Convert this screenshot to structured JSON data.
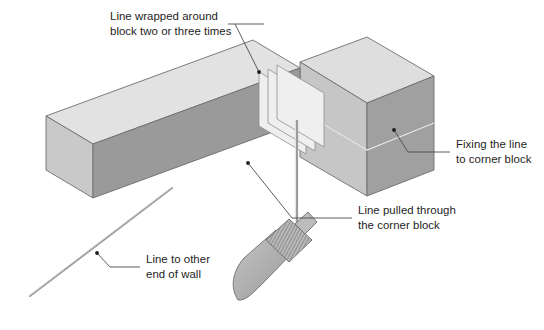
{
  "figure": {
    "background_color": "#ffffff",
    "annotations": [
      {
        "id": "line-wrapped",
        "line1": "Line wrapped around",
        "line2": "block two or three times"
      },
      {
        "id": "fixing-line",
        "line1": "Fixing the line",
        "line2": "to corner block"
      },
      {
        "id": "line-pulled",
        "line1": "Line pulled through",
        "line2": "the corner block"
      },
      {
        "id": "line-to-other-end",
        "line1": "Line to other",
        "line2": "end of wall"
      }
    ],
    "parts": {
      "stretcher_block_label": "stretcher block",
      "corner_block_label": "corner block",
      "line_pin_label": "line pin with coiled line",
      "masonry_line_label": "masonry line"
    },
    "colors": {
      "block_top": "#e2e2e2",
      "block_front": "#9a9a9a",
      "block_end": "#c9c9c9",
      "corner_front": "#c6c6c6",
      "corner_right": "#a0a0a0",
      "corner_top": "#dedede",
      "wrap_band": "#efefef",
      "outline": "#6e6e6e",
      "line_color": "#8c8c8c",
      "leader": "#4a4a4a",
      "text": "#1d1d1d",
      "tool_blade": "#b4b4b4",
      "tool_handle": "#a8a8a8"
    }
  }
}
